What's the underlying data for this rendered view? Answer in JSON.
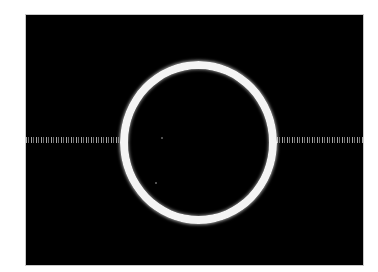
{
  "image": {
    "description": "Bright white ring on a black field with a faint horizontal dotted streak crossing through its center",
    "colors": {
      "background": "#000000",
      "ring": "#f4f4f4",
      "streak": "#e6e6e6",
      "page": "#ffffff",
      "border": "#c8c8c8"
    },
    "frame": {
      "x": 26,
      "y": 15,
      "width": 337,
      "height": 250
    },
    "ring": {
      "center_x": 198,
      "center_y": 142,
      "outer_radius_x": 79,
      "outer_radius_y": 81,
      "thickness": 8
    },
    "streak": {
      "y": 140,
      "left_segment": [
        26,
        120
      ],
      "right_segment": [
        277,
        363
      ]
    },
    "specks": [
      {
        "x": 161,
        "y": 137
      },
      {
        "x": 155,
        "y": 182
      }
    ]
  }
}
